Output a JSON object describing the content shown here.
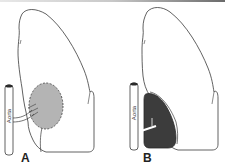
{
  "figure": {
    "panels": [
      {
        "id": "A",
        "label": "A",
        "aorta_label": "Aorta",
        "mass_style": "dashed-outline light-gray fill",
        "mass_color": "#b4b4b4"
      },
      {
        "id": "B",
        "label": "B",
        "aorta_label": "Aorta",
        "mass_style": "solid dark fill",
        "mass_color": "#3c3c3c"
      }
    ],
    "colors": {
      "outline": "#3a3a3a",
      "background": "#ffffff",
      "topbar_start": "#e8e8e8",
      "topbar_end": "#6a6a6a"
    }
  }
}
